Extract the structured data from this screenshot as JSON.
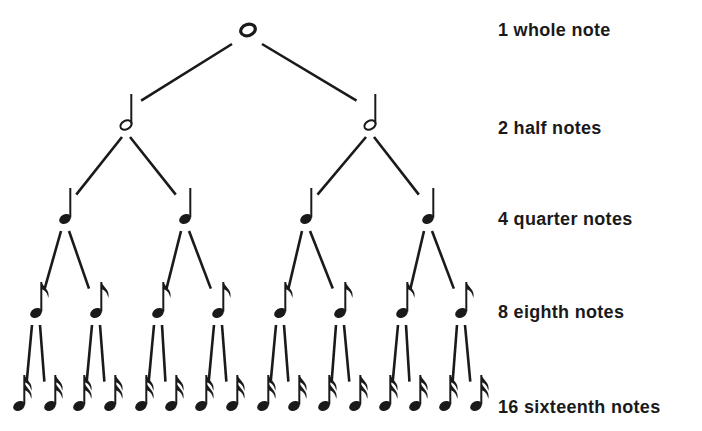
{
  "diagram": {
    "ink_color": "#1a1a1a",
    "levels": [
      {
        "count": 1,
        "label": "1 whole note",
        "note_type": "whole-note",
        "y": 30,
        "xs": [
          248
        ]
      },
      {
        "count": 2,
        "label": "2 half notes",
        "note_type": "half-note",
        "y": 125,
        "xs": [
          126,
          370
        ]
      },
      {
        "count": 4,
        "label": "4 quarter notes",
        "note_type": "quarter-note",
        "y": 219,
        "xs": [
          65,
          185,
          306,
          428
        ]
      },
      {
        "count": 8,
        "label": "8 eighth notes",
        "note_type": "eighth-note",
        "y": 313,
        "xs": [
          36,
          96,
          158,
          218,
          280,
          340,
          402,
          461
        ]
      },
      {
        "count": 16,
        "label": "16 sixteenth notes",
        "note_type": "sixteenth-note",
        "y": 406,
        "xs": [
          19,
          50,
          79,
          110,
          141,
          171,
          201,
          232,
          263,
          294,
          324,
          355,
          385,
          415,
          445,
          476
        ]
      }
    ],
    "label_ys": [
      33,
      132,
      224,
      317,
      412
    ]
  }
}
